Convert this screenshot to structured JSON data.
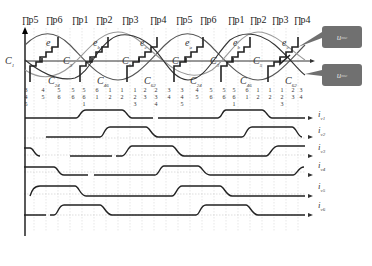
{
  "pulse_labels": [
    "p5",
    "p6",
    "p1",
    "p2",
    "p3",
    "p4",
    "p5",
    "p6",
    "p1",
    "p2",
    "p3",
    "p4"
  ],
  "pulse_positions": [
    22,
    46,
    72,
    96,
    122,
    150,
    176,
    200,
    228,
    250,
    272,
    294
  ],
  "callouts": [
    {
      "label": "u",
      "sub": "mc",
      "x": 322,
      "y": 26
    },
    {
      "label": "u",
      "sub": "mc",
      "x": 322,
      "y": 64
    }
  ],
  "waveform_labels": {
    "e": [
      {
        "t": "e",
        "s": "a",
        "x": 46,
        "y": 37
      },
      {
        "t": "e",
        "s": "b",
        "x": 93,
        "y": 37
      },
      {
        "t": "e",
        "s": "c",
        "x": 140,
        "y": 37
      },
      {
        "t": "e",
        "s": "a",
        "x": 185,
        "y": 37
      },
      {
        "t": "e",
        "s": "b",
        "x": 233,
        "y": 37
      },
      {
        "t": "e",
        "s": "c",
        "x": 282,
        "y": 37
      }
    ],
    "c_upper": [
      {
        "t": "C",
        "s": "1",
        "x": 5,
        "y": 55
      },
      {
        "t": "C",
        "s": "3",
        "x": 63,
        "y": 55
      },
      {
        "t": "C",
        "s": "5",
        "x": 122,
        "y": 55
      },
      {
        "t": "C",
        "s": "1",
        "x": 172,
        "y": 55
      },
      {
        "t": "C",
        "s": "3",
        "x": 210,
        "y": 55
      },
      {
        "t": "C",
        "s": "5",
        "x": 253,
        "y": 55
      }
    ],
    "c_lower": [
      {
        "t": "C",
        "s": "24",
        "x": 48,
        "y": 75
      },
      {
        "t": "C",
        "s": "46",
        "x": 97,
        "y": 75
      },
      {
        "t": "C",
        "s": "62",
        "x": 144,
        "y": 75
      },
      {
        "t": "C",
        "s": "24",
        "x": 190,
        "y": 75
      },
      {
        "t": "C",
        "s": "46",
        "x": 240,
        "y": 75
      },
      {
        "t": "C",
        "s": "62",
        "x": 285,
        "y": 75
      }
    ]
  },
  "conduction_sequence": [
    {
      "x": 22,
      "rows": [
        "3",
        "4",
        "5"
      ]
    },
    {
      "x": 39,
      "rows": [
        "4",
        "5"
      ]
    },
    {
      "x": 55,
      "rows": [
        "5",
        "6"
      ]
    },
    {
      "x": 69,
      "rows": [
        "5",
        "6"
      ]
    },
    {
      "x": 80,
      "rows": [
        "5",
        "6",
        "1"
      ]
    },
    {
      "x": 93,
      "rows": [
        "6",
        "1"
      ]
    },
    {
      "x": 106,
      "rows": [
        "1",
        "2"
      ]
    },
    {
      "x": 118,
      "rows": [
        "1",
        "2"
      ]
    },
    {
      "x": 131,
      "rows": [
        "1",
        "2",
        "3"
      ]
    },
    {
      "x": 141,
      "rows": [
        "2",
        "3"
      ]
    },
    {
      "x": 152,
      "rows": [
        "2",
        "3",
        "4"
      ]
    },
    {
      "x": 165,
      "rows": [
        "3",
        "4"
      ]
    },
    {
      "x": 178,
      "rows": [
        "3",
        "4",
        "5"
      ]
    },
    {
      "x": 193,
      "rows": [
        "4",
        "5"
      ]
    },
    {
      "x": 207,
      "rows": [
        "5",
        "6"
      ]
    },
    {
      "x": 220,
      "rows": [
        "5",
        "6"
      ]
    },
    {
      "x": 230,
      "rows": [
        "5",
        "6",
        "1"
      ]
    },
    {
      "x": 243,
      "rows": [
        "6",
        "1"
      ]
    },
    {
      "x": 254,
      "rows": [
        "1",
        "2"
      ]
    },
    {
      "x": 266,
      "rows": [
        "1",
        "2"
      ]
    },
    {
      "x": 278,
      "rows": [
        "1",
        "2",
        "3"
      ]
    },
    {
      "x": 289,
      "rows": [
        "2",
        "3"
      ]
    },
    {
      "x": 297,
      "rows": [
        "3",
        "4"
      ]
    }
  ],
  "current_labels": [
    {
      "t": "i",
      "s": "v1",
      "y": 117
    },
    {
      "t": "i",
      "s": "v2",
      "y": 133
    },
    {
      "t": "i",
      "s": "v3",
      "y": 150
    },
    {
      "t": "i",
      "s": "v4",
      "y": 168
    },
    {
      "t": "i",
      "s": "v5",
      "y": 189
    },
    {
      "t": "i",
      "s": "v6",
      "y": 208
    }
  ],
  "caption": ""
}
